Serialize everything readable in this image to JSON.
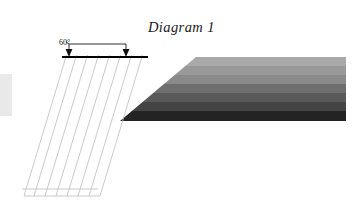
{
  "figure": {
    "title": "Diagram 1",
    "angle_label": "60°",
    "canvas": {
      "width": 353,
      "height": 218,
      "background": "#ffffff"
    }
  },
  "colors": {
    "grid_line": "#b9b9b9",
    "mesh_line": "#c4c4c4",
    "ground_line": "#000000",
    "arrow": "#111111",
    "dimension_line": "#1a1a1a",
    "left_strip": "#e6e6e6",
    "title_text": "#1a1a1a"
  },
  "ground_line": {
    "label": "ground-surface-line",
    "x1": 62,
    "y1": 57,
    "x2": 148,
    "y2": 57,
    "thickness": 2.2
  },
  "dimension": {
    "label": "60-degree-spacing-dimension",
    "bracket_y": 44,
    "left_x": 69,
    "right_x": 126,
    "arrow_left_x": 69,
    "arrow_right_x": 126,
    "arrow_tip_y": 56,
    "leader_from_x": 64,
    "leader_from_y": 41
  },
  "rotated_grid": {
    "label": "rotated-lattice-grid",
    "rotation_deg": -60,
    "origin_x": 79,
    "origin_y": 58,
    "cols": 6,
    "rows": 5,
    "cell_w": 11.5,
    "cell_h": 11.5,
    "description": "square lattice rotated 60 degrees from the ground line"
  },
  "mesh_rays": {
    "label": "lower-left-parallel-ray-bundle",
    "count": 6,
    "top_x_start": 66,
    "top_x_end": 120,
    "top_y": 58,
    "bottom_x_start": 22,
    "bottom_x_end": 152,
    "bottom_y": 200,
    "angle_deg": -72,
    "description": "long parallel lines fanning down-left from the contact point"
  },
  "left_strip": {
    "label": "left-edge-light-band",
    "x": 0,
    "y": 74,
    "width": 12,
    "height": 42
  },
  "beam": {
    "label": "horizontal-gradient-beam",
    "x": 30,
    "y": 57,
    "width": 316,
    "height": 64,
    "top_clip_x": 196,
    "bands": [
      {
        "name": "band-1",
        "color": "#a9a9a9",
        "height": 9
      },
      {
        "name": "band-2",
        "color": "#999999",
        "height": 9
      },
      {
        "name": "band-3",
        "color": "#8a8a8a",
        "height": 9
      },
      {
        "name": "band-4",
        "color": "#6e6e6e",
        "height": 9
      },
      {
        "name": "band-5",
        "color": "#5a5a5a",
        "height": 9
      },
      {
        "name": "band-6",
        "color": "#444444",
        "height": 9
      },
      {
        "name": "band-7",
        "color": "#232323",
        "height": 10
      }
    ]
  }
}
